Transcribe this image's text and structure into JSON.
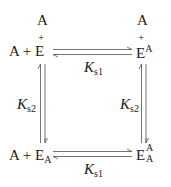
{
  "diagram": {
    "type": "thermodynamic-binding-cycle",
    "nodes": {
      "top_left": {
        "stack_top": "A",
        "stack_plus": "+",
        "prefix": "A + ",
        "species": "E",
        "sub": "",
        "sup": ""
      },
      "top_right": {
        "stack_top": "A",
        "stack_plus": "+",
        "species": "E",
        "sub": "",
        "sup": "A"
      },
      "bottom_left": {
        "prefix": "A + ",
        "species": "E",
        "sub": "A",
        "sup": ""
      },
      "bottom_right": {
        "species": "E",
        "sub": "A",
        "sup": "A"
      }
    },
    "edges": {
      "top": {
        "label_main": "K",
        "label_sub": "s1",
        "from": "top_left",
        "to": "top_right",
        "direction": "reversible"
      },
      "bottom": {
        "label_main": "K",
        "label_sub": "s1",
        "from": "bottom_left",
        "to": "bottom_right",
        "direction": "reversible"
      },
      "left": {
        "label_main": "K",
        "label_sub": "s2",
        "from": "top_left",
        "to": "bottom_left",
        "direction": "reversible"
      },
      "right": {
        "label_main": "K",
        "label_sub": "s2",
        "from": "top_right",
        "to": "bottom_right",
        "direction": "reversible"
      }
    },
    "colors": {
      "text": "#222222",
      "arrow": "#666666"
    }
  }
}
